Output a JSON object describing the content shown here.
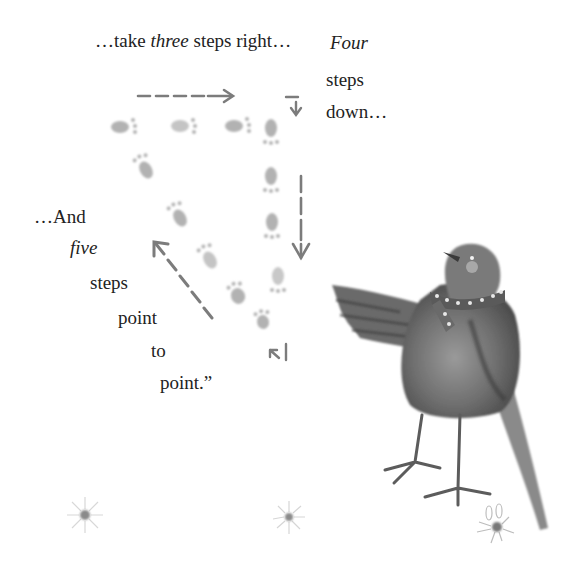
{
  "page": {
    "type": "picture-book-page",
    "background": "#ffffff"
  },
  "text": {
    "line1": {
      "pre": "…take ",
      "emph": "three",
      "post": " steps right…"
    },
    "four_block": [
      "Four",
      "steps",
      "down…"
    ],
    "five_block": [
      "…And",
      "five",
      "steps",
      "point",
      "to",
      "point.”"
    ]
  },
  "illustration": {
    "subject": "bird-with-polka-dot-scarf",
    "footprints": {
      "right": 3,
      "down": 4,
      "diagonal": 5
    },
    "arrows": [
      "right-arrow",
      "down-arrow-short",
      "down-arrow-long",
      "diagonal-up-left-arrow",
      "small-up-left-arrow"
    ],
    "flowers": 3,
    "ink_color": "#7a7a7a",
    "print_color": "#b4b4b4"
  }
}
